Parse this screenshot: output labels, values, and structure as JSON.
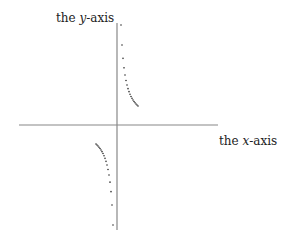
{
  "diagram": {
    "y_axis_label": {
      "prefix": "the ",
      "var": "y",
      "suffix": "-axis"
    },
    "x_axis_label": {
      "prefix": "the ",
      "var": "x",
      "suffix": "-axis"
    },
    "origin_px": [
      117,
      125
    ],
    "x_axis_px": [
      19,
      218
    ],
    "y_axis_px": [
      23,
      230
    ],
    "curve": {
      "type": "hyperbola",
      "equation": "y = k/x",
      "k_px": 400,
      "dx_range_px": [
        4,
        21
      ],
      "point_color": "#333333"
    },
    "axis_color": "#888888"
  }
}
